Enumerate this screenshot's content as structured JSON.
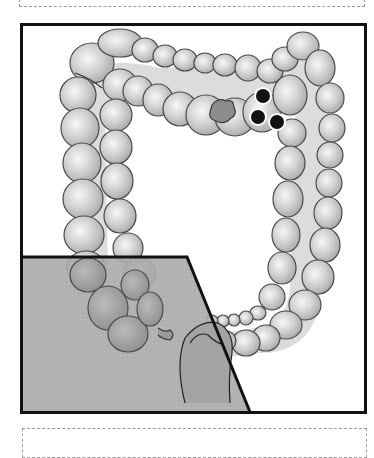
{
  "figure": {
    "title": "Colon illustration",
    "colors": {
      "frame": "#111111",
      "colon_fill": "#cfcfcf",
      "colon_highlight": "#f4f4f4",
      "colon_outline": "#4a4a4a",
      "lumen": "#dcdcdc",
      "pelvis_overlay": "#a9a9a9",
      "polyp": "#8c8c8c",
      "markers": "#111111"
    },
    "elements": {
      "polyp": "polyp",
      "markers": [
        "marker-1",
        "marker-2",
        "marker-3"
      ],
      "overlay": "pelvic-region-overlay"
    }
  },
  "top_box": {
    "text": ""
  },
  "bottom_box": {
    "text": ""
  }
}
